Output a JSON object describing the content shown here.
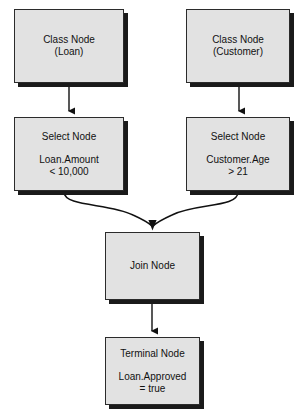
{
  "diagram": {
    "type": "flowchart",
    "canvas": {
      "width": 295,
      "height": 418
    },
    "style": {
      "node_fill": "#e2e2e2",
      "node_border": "#2b2b2b",
      "node_shadow": "#1a1a1a",
      "edge_color": "#111111",
      "background": "#ffffff"
    },
    "nodes": [
      {
        "id": "class-loan",
        "kind": "class-node",
        "title": "Class Node",
        "detail": "(Loan)",
        "lines": [
          "Class Node",
          "(Loan)"
        ],
        "x": 14,
        "y": 9,
        "w": 110,
        "h": 74
      },
      {
        "id": "class-customer",
        "kind": "class-node",
        "title": "Class Node",
        "detail": "(Customer)",
        "lines": [
          "Class Node",
          "(Customer)"
        ],
        "x": 186,
        "y": 9,
        "w": 104,
        "h": 74
      },
      {
        "id": "select-loan",
        "kind": "select-node",
        "title": "Select Node",
        "expr_field": "Loan.Amount",
        "expr_test": "< 10,000",
        "lines": [
          "Select Node",
          "Loan.Amount",
          "< 10,000"
        ],
        "x": 14,
        "y": 117,
        "w": 110,
        "h": 74
      },
      {
        "id": "select-customer",
        "kind": "select-node",
        "title": "Select Node",
        "expr_field": "Customer.Age",
        "expr_test": "> 21",
        "lines": [
          "Select Node",
          "Customer.Age",
          "> 21"
        ],
        "x": 186,
        "y": 117,
        "w": 104,
        "h": 74
      },
      {
        "id": "join",
        "kind": "join-node",
        "title": "Join Node",
        "detail": "",
        "lines": [
          "Join Node"
        ],
        "x": 105,
        "y": 232,
        "w": 95,
        "h": 68
      },
      {
        "id": "terminal",
        "kind": "terminal-node",
        "title": "Terminal Node",
        "expr_field": "Loan.Approved",
        "expr_test": "= true",
        "lines": [
          "Terminal Node",
          "Loan.Approved",
          "= true"
        ],
        "x": 105,
        "y": 337,
        "w": 95,
        "h": 68
      }
    ],
    "edges": [
      {
        "id": "e1",
        "from": "class-loan",
        "to": "select-loan",
        "shape": "straight",
        "arrow": true
      },
      {
        "id": "e2",
        "from": "class-customer",
        "to": "select-customer",
        "shape": "straight",
        "arrow": true
      },
      {
        "id": "e3",
        "from": "select-loan",
        "to": "join",
        "shape": "curve",
        "arrow": true
      },
      {
        "id": "e4",
        "from": "select-customer",
        "to": "join",
        "shape": "curve",
        "arrow": true
      },
      {
        "id": "e5",
        "from": "join",
        "to": "terminal",
        "shape": "straight",
        "arrow": true
      }
    ]
  }
}
